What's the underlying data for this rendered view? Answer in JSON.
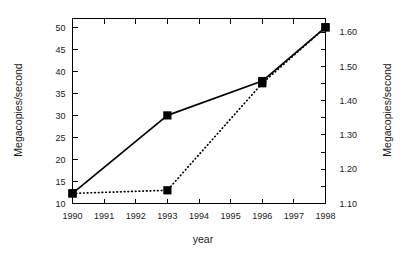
{
  "chart_data": {
    "type": "line",
    "title": "",
    "xlabel": "year",
    "ylabel": "Megacopies/second",
    "y2label": "Megacopies/second",
    "x": [
      1990,
      1991,
      1992,
      1993,
      1994,
      1995,
      1996,
      1997,
      1998
    ],
    "xtick_labels": [
      "1990",
      "1991",
      "1992",
      "1993",
      "1994",
      "1995",
      "1996",
      "1997",
      "1998"
    ],
    "xlim": [
      1990,
      1998
    ],
    "ylim": [
      10,
      52
    ],
    "ytick_labels": [
      "10",
      "15",
      "20",
      "25",
      "30",
      "35",
      "40",
      "45",
      "50"
    ],
    "ytick_values": [
      10,
      15,
      20,
      25,
      30,
      35,
      40,
      45,
      50
    ],
    "y2lim": [
      1.1,
      1.64
    ],
    "y2tick_labels": [
      "1.10",
      "1.20",
      "1.30",
      "1.40",
      "1.50",
      "1.60"
    ],
    "y2tick_values": [
      1.1,
      1.2,
      1.3,
      1.4,
      1.5,
      1.6
    ],
    "y2_minor_values": [
      1.15,
      1.25,
      1.35,
      1.45,
      1.55
    ],
    "grid": false,
    "legend": "none",
    "series": [
      {
        "name": "solid-series",
        "style": "solid",
        "marker": "filled-square",
        "axis": "left",
        "points": [
          {
            "x": 1990,
            "y": 12.3
          },
          {
            "x": 1993,
            "y": 30.0
          },
          {
            "x": 1996,
            "y": 37.8
          },
          {
            "x": 1998,
            "y": 50.0
          }
        ]
      },
      {
        "name": "dotted-series",
        "style": "dotted",
        "marker": "filled-square",
        "axis": "left",
        "points": [
          {
            "x": 1990,
            "y": 12.3
          },
          {
            "x": 1993,
            "y": 13.0
          },
          {
            "x": 1996,
            "y": 37.3
          },
          {
            "x": 1998,
            "y": 50.0
          }
        ]
      }
    ]
  }
}
